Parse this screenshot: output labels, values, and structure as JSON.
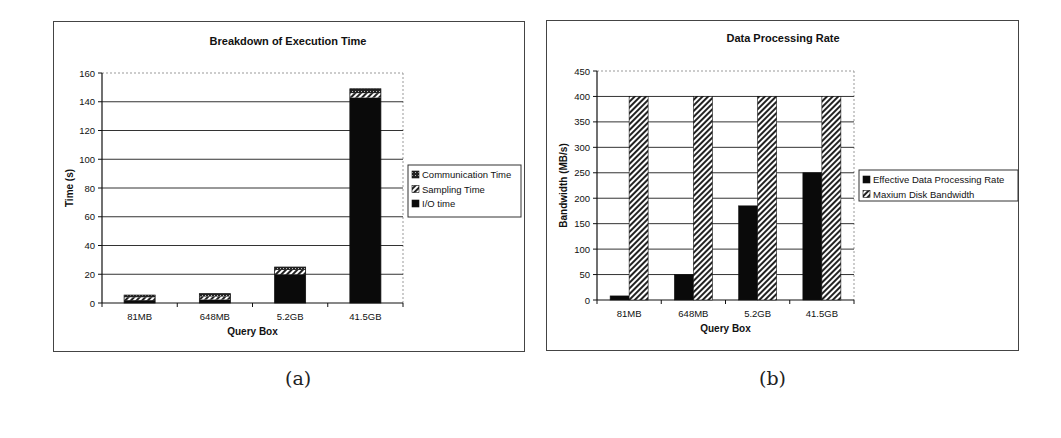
{
  "chart_data": [
    {
      "id": "a",
      "type": "bar",
      "stacked": true,
      "title": "Breakdown of Execution Time",
      "xlabel": "Query Box",
      "ylabel": "Time (s)",
      "categories": [
        "81MB",
        "648MB",
        "5.2GB",
        "41.5GB"
      ],
      "ylim": [
        0,
        160
      ],
      "yticks": [
        0,
        20,
        40,
        60,
        80,
        100,
        120,
        140,
        160
      ],
      "grid": true,
      "legend_position": "right",
      "series": [
        {
          "name": "I/O time",
          "values": [
            2,
            2.5,
            20,
            143
          ],
          "pattern": "solid-black"
        },
        {
          "name": "Sampling Time",
          "values": [
            2,
            2,
            3,
            3
          ],
          "pattern": "diagonal-hatch"
        },
        {
          "name": "Communication Time",
          "values": [
            1.5,
            2,
            2,
            3
          ],
          "pattern": "dotted-dark"
        }
      ],
      "legend": [
        "Communication Time",
        "Sampling Time",
        "I/O time"
      ]
    },
    {
      "id": "b",
      "type": "bar",
      "stacked": false,
      "title": "Data Processing Rate",
      "xlabel": "Query Box",
      "ylabel": "Bandwidth (MB/s)",
      "categories": [
        "81MB",
        "648MB",
        "5.2GB",
        "41.5GB"
      ],
      "ylim": [
        0,
        450
      ],
      "yticks": [
        0,
        50,
        100,
        150,
        200,
        250,
        300,
        350,
        400,
        450
      ],
      "grid": true,
      "legend_position": "right",
      "series": [
        {
          "name": "Effective Data Processing Rate",
          "values": [
            8,
            50,
            185,
            250
          ],
          "pattern": "solid-black"
        },
        {
          "name": "Maxium Disk Bandwidth",
          "values": [
            400,
            400,
            400,
            400
          ],
          "pattern": "diagonal-hatch"
        }
      ],
      "legend": [
        "Effective Data Processing Rate",
        "Maxium Disk Bandwidth"
      ]
    }
  ],
  "captions": {
    "a": "(a)",
    "b": "(b)"
  }
}
